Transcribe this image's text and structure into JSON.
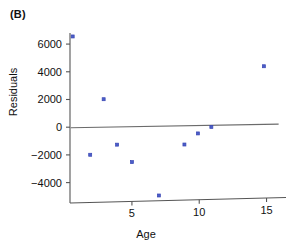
{
  "panel": {
    "label": "(B)"
  },
  "chart_data": {
    "type": "scatter",
    "title": "",
    "subtitle": "",
    "xlabel": "Age",
    "ylabel": "Residuals",
    "xlim": [
      0.4,
      16.0
    ],
    "ylim": [
      -5400,
      6800
    ],
    "xticks": [
      5,
      10,
      15
    ],
    "xtick_labels": [
      "5",
      "10",
      "15"
    ],
    "yticks": [
      6000,
      4000,
      2000,
      0,
      -2000,
      -4000
    ],
    "ytick_labels": [
      "6000",
      "4000",
      "2000",
      "0",
      "−2000",
      "−4000"
    ],
    "grid": false,
    "legend": null,
    "points": [
      {
        "x": 0.6,
        "y": 6550
      },
      {
        "x": 2.9,
        "y": 2020
      },
      {
        "x": 1.9,
        "y": -1990
      },
      {
        "x": 3.9,
        "y": -1260
      },
      {
        "x": 5.0,
        "y": -2520
      },
      {
        "x": 7.0,
        "y": -4930
      },
      {
        "x": 8.9,
        "y": -1250
      },
      {
        "x": 9.9,
        "y": -450
      },
      {
        "x": 10.9,
        "y": 20
      },
      {
        "x": 14.8,
        "y": 4400
      }
    ],
    "reference_line": {
      "name": "zero-residual-trend-line",
      "x_start": 0.45,
      "y_start": -40,
      "x_end": 15.9,
      "y_end": 215,
      "color": "#6b6b6b"
    },
    "marker": {
      "shape": "square",
      "size_px": 3,
      "fill_color": "#4a5ec8",
      "edge_color": "#3a46b4"
    },
    "axis_color": "#555555"
  }
}
